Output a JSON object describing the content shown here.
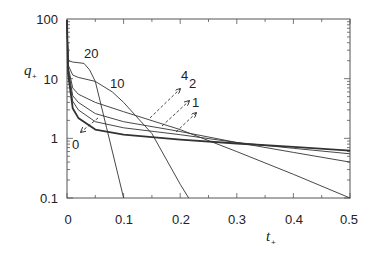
{
  "chart_data": {
    "type": "line",
    "title": "",
    "xlabel": "t+",
    "ylabel": "q+",
    "xlim": [
      0,
      0.5
    ],
    "ylim": [
      0.1,
      100
    ],
    "yscale": "log",
    "xticks": [
      "0",
      "0.1",
      "0.2",
      "0.3",
      "0.4",
      "0.5"
    ],
    "yticks": [
      "0.1",
      "1",
      "10",
      "100"
    ],
    "grid": false,
    "legend": "none (curves labeled inline with parameter values 0, 1, 2, 4, 10, 20)",
    "series": [
      {
        "name": "0",
        "x": [
          0.002,
          0.01,
          0.02,
          0.05,
          0.1,
          0.2,
          0.3,
          0.4,
          0.5
        ],
        "y": [
          12,
          3.2,
          2.2,
          1.4,
          1.15,
          0.95,
          0.82,
          0.72,
          0.62
        ]
      },
      {
        "name": "1",
        "x": [
          0.002,
          0.01,
          0.02,
          0.05,
          0.1,
          0.2,
          0.3,
          0.4,
          0.5
        ],
        "y": [
          14,
          4.2,
          3.0,
          1.9,
          1.5,
          1.15,
          0.85,
          0.68,
          0.55
        ]
      },
      {
        "name": "2",
        "x": [
          0.002,
          0.01,
          0.02,
          0.05,
          0.1,
          0.2,
          0.3,
          0.4,
          0.5
        ],
        "y": [
          15,
          5.2,
          4.0,
          2.6,
          1.9,
          1.3,
          0.85,
          0.58,
          0.4
        ]
      },
      {
        "name": "4",
        "x": [
          0.002,
          0.01,
          0.02,
          0.05,
          0.1,
          0.2,
          0.3,
          0.4,
          0.5
        ],
        "y": [
          16,
          7.0,
          5.5,
          4.0,
          2.8,
          1.4,
          0.6,
          0.25,
          0.1
        ]
      },
      {
        "name": "10",
        "x": [
          0.002,
          0.01,
          0.02,
          0.05,
          0.08,
          0.1,
          0.15,
          0.2,
          0.215
        ],
        "y": [
          17,
          11.5,
          10.5,
          9.0,
          6.0,
          4.0,
          1.2,
          0.17,
          0.1
        ]
      },
      {
        "name": "20",
        "x": [
          0.002,
          0.01,
          0.03,
          0.04,
          0.05,
          0.07,
          0.09,
          0.1
        ],
        "y": [
          20,
          19,
          18,
          14,
          9,
          1.5,
          0.25,
          0.1
        ]
      }
    ],
    "annotations": [
      {
        "text": "20",
        "near": [
          0.03,
          22
        ]
      },
      {
        "text": "10",
        "near": [
          0.1,
          11
        ]
      },
      {
        "text": "4",
        "arrow": "dashed, pointing upper-right from curve 4"
      },
      {
        "text": "2",
        "arrow": "dashed, pointing upper-right from curve 2"
      },
      {
        "text": "1",
        "arrow": "dashed, pointing upper-right from curve 1"
      },
      {
        "text": "0",
        "arrow": "dashed, pointing lower-left from curve 0"
      }
    ]
  },
  "labels": {
    "xlabel_main": "t",
    "xlabel_sub": "+",
    "ylabel_main": "q",
    "ylabel_sub": "+",
    "xticks": [
      "0",
      "0.1",
      "0.2",
      "0.3",
      "0.4",
      "0.5"
    ],
    "yticks": [
      "0.1",
      "1",
      "10",
      "100"
    ],
    "curve_20": "20",
    "curve_10": "10",
    "curve_4": "4",
    "curve_2": "2",
    "curve_1": "1",
    "curve_0": "0"
  },
  "colors": {
    "line": "#333333",
    "frame": "#555555"
  }
}
